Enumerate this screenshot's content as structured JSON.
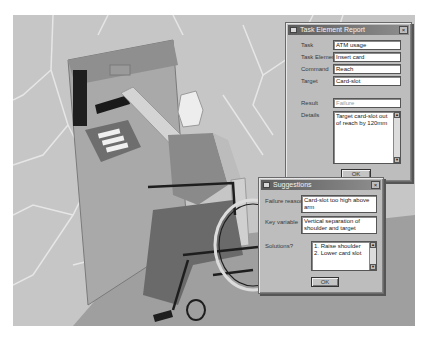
{
  "task_report": {
    "title": "Task Element Report",
    "fields": [
      {
        "label": "Task",
        "value": "ATM usage"
      },
      {
        "label": "Task Element",
        "value": "Insert card"
      },
      {
        "label": "Command",
        "value": "Reach"
      },
      {
        "label": "Target",
        "value": "Card-slot"
      },
      {
        "label": "Result",
        "value": "Failure"
      }
    ],
    "details_label": "Details",
    "details_value": "Target card-slot out of reach by 120mm",
    "ok_label": "OK"
  },
  "suggestions": {
    "title": "Suggestions",
    "failure_reason_label": "Failure reason",
    "failure_reason_value": "Card-slot too high above arm",
    "key_variable_label": "Key variable",
    "key_variable_value": "Vertical separation of shoulder and target",
    "solutions_label": "Solutions?",
    "solutions": [
      "1. Raise shoulder",
      "2. Lower card slot"
    ],
    "ok_label": "OK"
  },
  "icons": {
    "close": "×",
    "scroll_up": "▲",
    "scroll_down": "▼"
  },
  "colors": {
    "scene_bg": "#c9c9c9",
    "dialog_bg": "#bdbdbd",
    "titlebar": "#5e5e5e"
  }
}
